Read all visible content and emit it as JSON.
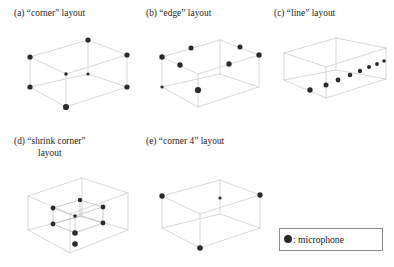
{
  "figure": {
    "background_color": "#ffffff",
    "wire_color": "#d8d8d8",
    "wire_color_dark": "#bdbdbd",
    "dot_color": "#2b2b2b",
    "legend": {
      "name": "legend-box",
      "marker": "filled-circle",
      "text": ": microphone",
      "border_color": "#8d8d8d",
      "x": 279,
      "y": 228,
      "width": 104,
      "height": 23
    },
    "panels": [
      {
        "id": "a",
        "label": "(a) “corner” layout",
        "caption_lines": [
          "(a) “corner” layout"
        ],
        "caption_x": 14,
        "caption_y": 8,
        "diagram_x": 14,
        "diagram_y": 24,
        "mic_count": 8,
        "description": "rectangular room wireframe with microphones at all eight corners",
        "room": {
          "top": [
            [
              16,
              33
            ],
            [
              74,
              16
            ],
            [
              113,
              31
            ],
            [
              52,
              50
            ]
          ],
          "bottom": [
            [
              16,
              63
            ],
            [
              74,
              50
            ],
            [
              113,
              63
            ],
            [
              52,
              83
            ]
          ]
        },
        "mics": [
          {
            "x": 16,
            "y": 33,
            "r": 2.6
          },
          {
            "x": 74,
            "y": 16,
            "r": 2.6
          },
          {
            "x": 113,
            "y": 31,
            "r": 2.6
          },
          {
            "x": 52,
            "y": 50,
            "r": 1.8
          },
          {
            "x": 16,
            "y": 63,
            "r": 2.6
          },
          {
            "x": 74,
            "y": 50,
            "r": 1.6
          },
          {
            "x": 113,
            "y": 63,
            "r": 2.6
          },
          {
            "x": 52,
            "y": 83,
            "r": 3.1
          }
        ]
      },
      {
        "id": "b",
        "label": "(b) “edge” layout",
        "caption_lines": [
          "(b) “edge” layout"
        ],
        "caption_x": 146,
        "caption_y": 8,
        "diagram_x": 146,
        "diagram_y": 24,
        "mic_count": 8,
        "description": "rectangular room wireframe with microphones at edge midpoints",
        "room": {
          "top": [
            [
              16,
              33
            ],
            [
              74,
              16
            ],
            [
              113,
              31
            ],
            [
              52,
              50
            ]
          ],
          "bottom": [
            [
              16,
              63
            ],
            [
              74,
              50
            ],
            [
              113,
              63
            ],
            [
              52,
              83
            ]
          ]
        },
        "mics": [
          {
            "x": 45,
            "y": 24,
            "r": 2.5
          },
          {
            "x": 94,
            "y": 23,
            "r": 2.5
          },
          {
            "x": 16,
            "y": 33,
            "r": 2.7
          },
          {
            "x": 113,
            "y": 31,
            "r": 2.7
          },
          {
            "x": 34,
            "y": 41,
            "r": 2.7
          },
          {
            "x": 83,
            "y": 40,
            "r": 2.7
          },
          {
            "x": 16,
            "y": 63,
            "r": 1.6
          },
          {
            "x": 52,
            "y": 66,
            "r": 3.1
          }
        ]
      },
      {
        "id": "c",
        "label": "(c) “line” layout",
        "caption_lines": [
          "(c) “line” layout"
        ],
        "caption_x": 274,
        "caption_y": 8,
        "diagram_x": 274,
        "diagram_y": 24,
        "mic_count": 8,
        "description": "rectangular room wireframe with eight microphones along a straight diagonal line",
        "room": {
          "top": [
            [
              10,
              29
            ],
            [
              62,
              14
            ],
            [
              112,
              24
            ],
            [
              52,
              43
            ]
          ],
          "bottom": [
            [
              10,
              56
            ],
            [
              62,
              46
            ],
            [
              112,
              55
            ],
            [
              52,
              74
            ]
          ]
        },
        "mics": [
          {
            "x": 36,
            "y": 66,
            "r": 2.7
          },
          {
            "x": 52,
            "y": 61,
            "r": 2.5
          },
          {
            "x": 64,
            "y": 56,
            "r": 2.4
          },
          {
            "x": 76,
            "y": 51,
            "r": 2.3
          },
          {
            "x": 86,
            "y": 47,
            "r": 2.2
          },
          {
            "x": 95,
            "y": 43,
            "r": 2.0
          },
          {
            "x": 103,
            "y": 40,
            "r": 1.9
          },
          {
            "x": 110,
            "y": 37,
            "r": 1.8
          }
        ]
      },
      {
        "id": "d",
        "label": "(d) “shrink corner” layout",
        "caption_lines": [
          "(d) “shrink corner”",
          "layout"
        ],
        "caption_x": 14,
        "caption_y": 136,
        "diagram_x": 18,
        "diagram_y": 168,
        "mic_count": 8,
        "description": "rectangular room wireframe containing a smaller inner box with microphones at its eight corners",
        "room": {
          "top": [
            [
              10,
              28
            ],
            [
              64,
              10
            ],
            [
              110,
              25
            ],
            [
              52,
              46
            ]
          ],
          "bottom": [
            [
              10,
              62
            ],
            [
              64,
              48
            ],
            [
              110,
              62
            ],
            [
              52,
              85
            ]
          ]
        },
        "inner": {
          "top": [
            [
              35,
              40
            ],
            [
              62,
              32
            ],
            [
              85,
              39
            ],
            [
              57,
              48
            ]
          ],
          "bottom": [
            [
              35,
              56
            ],
            [
              62,
              48
            ],
            [
              85,
              55
            ],
            [
              57,
              65
            ]
          ]
        },
        "mics": [
          {
            "x": 62,
            "y": 32,
            "r": 2.2
          },
          {
            "x": 35,
            "y": 40,
            "r": 2.4
          },
          {
            "x": 85,
            "y": 39,
            "r": 2.4
          },
          {
            "x": 57,
            "y": 48,
            "r": 1.8
          },
          {
            "x": 35,
            "y": 56,
            "r": 2.4
          },
          {
            "x": 85,
            "y": 55,
            "r": 2.4
          },
          {
            "x": 57,
            "y": 65,
            "r": 2.8
          },
          {
            "x": 57,
            "y": 76,
            "r": 2.8
          }
        ]
      },
      {
        "id": "e",
        "label": "(e) “corner 4” layout",
        "caption_lines": [
          "(e) “corner 4” layout"
        ],
        "caption_x": 146,
        "caption_y": 136,
        "diagram_x": 150,
        "diagram_y": 168,
        "mic_count": 4,
        "description": "rectangular room wireframe with microphones at four alternating corners",
        "room": {
          "top": [
            [
              12,
              28
            ],
            [
              70,
              12
            ],
            [
              110,
              27
            ],
            [
              50,
              46
            ]
          ],
          "bottom": [
            [
              12,
              60
            ],
            [
              70,
              46
            ],
            [
              110,
              60
            ],
            [
              50,
              80
            ]
          ]
        },
        "mics": [
          {
            "x": 12,
            "y": 28,
            "r": 2.7
          },
          {
            "x": 70,
            "y": 30,
            "r": 1.6
          },
          {
            "x": 110,
            "y": 27,
            "r": 2.7
          },
          {
            "x": 50,
            "y": 80,
            "r": 2.8
          }
        ]
      }
    ]
  },
  "chart_data": {
    "type": "diagram",
    "legend_entries": [
      {
        "marker": "filled-circle",
        "label": "microphone"
      }
    ],
    "panels": [
      {
        "id": "a",
        "label": "(a) “corner” layout",
        "mic_count": 8
      },
      {
        "id": "b",
        "label": "(b) “edge” layout",
        "mic_count": 8
      },
      {
        "id": "c",
        "label": "(c) “line” layout",
        "mic_count": 8
      },
      {
        "id": "d",
        "label": "(d) “shrink corner” layout",
        "mic_count": 8
      },
      {
        "id": "e",
        "label": "(e) “corner 4” layout",
        "mic_count": 4
      }
    ]
  }
}
